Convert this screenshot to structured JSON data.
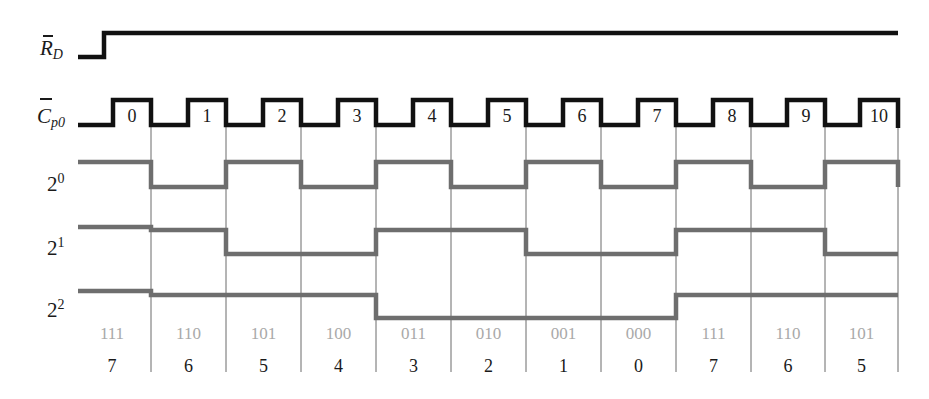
{
  "labels": {
    "rd": {
      "base": "R",
      "sub": "D"
    },
    "cp0": {
      "base": "C",
      "sub": "p0"
    },
    "q0": {
      "base": "2",
      "sup": "0"
    },
    "q1": {
      "base": "2",
      "sup": "1"
    },
    "q2": {
      "base": "2",
      "sup": "2"
    }
  },
  "clock_pulses": [
    "0",
    "1",
    "2",
    "3",
    "4",
    "5",
    "6",
    "7",
    "8",
    "9",
    "10"
  ],
  "states_binary": [
    "111",
    "110",
    "101",
    "100",
    "011",
    "010",
    "001",
    "000",
    "111",
    "110",
    "101"
  ],
  "states_decimal": [
    "7",
    "6",
    "5",
    "4",
    "3",
    "2",
    "1",
    "0",
    "7",
    "6",
    "5"
  ],
  "colors": {
    "signal_black": "#111111",
    "signal_gray": "#6e6e6e",
    "grid_line": "#6a6a6a",
    "binary_text": "#a9a9a9",
    "text": "#1a1a1a"
  },
  "chart_data": {
    "type": "timing-diagram",
    "title": "",
    "signals": [
      {
        "name": "R̄D",
        "levels": "low then high (reset released before first clock)"
      },
      {
        "name": "C̄p0",
        "pulses": 11,
        "pulse_labels": [
          0,
          1,
          2,
          3,
          4,
          5,
          6,
          7,
          8,
          9,
          10
        ]
      },
      {
        "name": "2^0",
        "values": [
          1,
          0,
          1,
          0,
          1,
          0,
          1,
          0,
          1,
          0,
          1
        ]
      },
      {
        "name": "2^1",
        "values": [
          1,
          1,
          0,
          0,
          1,
          1,
          0,
          0,
          1,
          1,
          0
        ]
      },
      {
        "name": "2^2",
        "values": [
          1,
          1,
          1,
          1,
          0,
          0,
          0,
          0,
          1,
          1,
          1
        ]
      }
    ],
    "states_binary": [
      "111",
      "110",
      "101",
      "100",
      "011",
      "010",
      "001",
      "000",
      "111",
      "110",
      "101"
    ],
    "states_decimal": [
      7,
      6,
      5,
      4,
      3,
      2,
      1,
      0,
      7,
      6,
      5
    ]
  }
}
